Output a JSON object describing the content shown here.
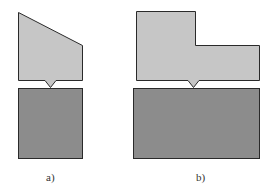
{
  "figure": {
    "panels": [
      {
        "id": "a",
        "label": "a)",
        "upper_shape": "sloped-top-block",
        "lower_shape": "rectangular-block"
      },
      {
        "id": "b",
        "label": "b)",
        "upper_shape": "stepped-block",
        "lower_shape": "wide-rectangular-block"
      }
    ],
    "colors": {
      "upper_fill": "#c6c6c6",
      "lower_fill": "#8c8c8c",
      "stroke": "#2a2a2a",
      "background": "#ffffff"
    }
  }
}
